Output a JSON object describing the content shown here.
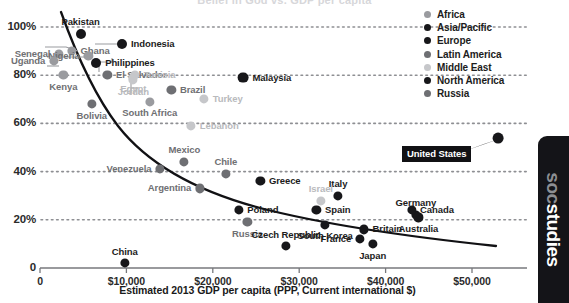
{
  "title_clipped": "Belief in God vs. GDP per capita",
  "axes": {
    "y_ticks": [
      "100%",
      "80%",
      "60%",
      "40%",
      "20%",
      "0"
    ],
    "x_ticks": [
      "0",
      "$10,000",
      "$20,000",
      "$30,000",
      "$40,000",
      "$50,000"
    ],
    "x_title": "Estimated 2013 GDP per capita (PPP, Current international $)"
  },
  "legend": {
    "items": [
      {
        "label": "Africa",
        "color": "#9a9b9f"
      },
      {
        "label": "Asia/Pacific",
        "color": "#17171a"
      },
      {
        "label": "Europe",
        "color": "#17171a"
      },
      {
        "label": "Latin America",
        "color": "#6e6f73"
      },
      {
        "label": "Middle East",
        "color": "#c6c7ca"
      },
      {
        "label": "North America",
        "color": "#17171a"
      },
      {
        "label": "Russia",
        "color": "#6e6f73"
      }
    ]
  },
  "callout": {
    "label": "United States"
  },
  "brand": {
    "part1": "soc",
    "part2": "studies"
  },
  "colors": {
    "africa": "#9a9b9f",
    "asia_pacific": "#17171a",
    "europe": "#17171a",
    "latin_america": "#6e6f73",
    "middle_east": "#c6c7ca",
    "north_america": "#17171a",
    "russia": "#6e6f73",
    "trendline": "#111114",
    "gridline": "#8e8f93"
  },
  "chart_data": {
    "type": "scatter",
    "title": "Belief in God vs. GDP per capita",
    "xlabel": "Estimated 2013 GDP per capita (PPP, Current international $)",
    "ylabel": "",
    "xlim": [
      0,
      56000
    ],
    "ylim": [
      0,
      108
    ],
    "grid": "horizontal dotted",
    "legend_position": "top-right",
    "series_key": "region",
    "points": [
      {
        "name": "Pakistan",
        "region": "Asia/Pacific",
        "x": 4700,
        "y": 97,
        "label_pos": "above",
        "color": "#17171a",
        "size": 5.0
      },
      {
        "name": "Indonesia",
        "region": "Asia/Pacific",
        "x": 9500,
        "y": 93,
        "label_pos": "right",
        "color": "#17171a",
        "size": 5.0
      },
      {
        "name": "Ghana",
        "region": "Africa",
        "x": 3700,
        "y": 90,
        "label_pos": "right",
        "color": "#9a9b9f",
        "size": 4.6
      },
      {
        "name": "Senegal",
        "region": "Africa",
        "x": 2200,
        "y": 89,
        "label_pos": "left",
        "color": "#9a9b9f",
        "size": 4.6
      },
      {
        "name": "Nigeria",
        "region": "Africa",
        "x": 5600,
        "y": 88,
        "label_pos": "left",
        "color": "#9a9b9f",
        "size": 4.6
      },
      {
        "name": "Uganda",
        "region": "Africa",
        "x": 1600,
        "y": 86,
        "label_pos": "left",
        "color": "#9a9b9f",
        "size": 4.6
      },
      {
        "name": "Philippines",
        "region": "Asia/Pacific",
        "x": 6500,
        "y": 85,
        "label_pos": "right",
        "color": "#17171a",
        "size": 5.0
      },
      {
        "name": "El Salvador",
        "region": "Latin America",
        "x": 7800,
        "y": 80,
        "label_pos": "right",
        "color": "#6e6f73",
        "size": 4.6
      },
      {
        "name": "Kenya",
        "region": "Africa",
        "x": 2700,
        "y": 80,
        "label_pos": "below",
        "color": "#9a9b9f",
        "size": 4.6
      },
      {
        "name": "Egypt",
        "region": "Middle East",
        "x": 10800,
        "y": 79,
        "label_pos": "below",
        "color": "#c6c7ca",
        "size": 4.6
      },
      {
        "name": "Jordan",
        "region": "Middle East",
        "x": 10800,
        "y": 78,
        "label_pos": "below",
        "color": "#c6c7ca",
        "size": 4.6
      },
      {
        "name": "Tunisia",
        "region": "Middle East",
        "x": 11000,
        "y": 80,
        "label_pos": "right",
        "color": "#c6c7ca",
        "size": 4.6
      },
      {
        "name": "Malaysia",
        "region": "Asia/Pacific",
        "x": 23500,
        "y": 79,
        "label_pos": "right",
        "color": "#17171a",
        "size": 5.4
      },
      {
        "name": "Brazil",
        "region": "Latin America",
        "x": 15200,
        "y": 74,
        "label_pos": "right",
        "color": "#6e6f73",
        "size": 4.6
      },
      {
        "name": "Turkey",
        "region": "Middle East",
        "x": 19000,
        "y": 70,
        "label_pos": "right",
        "color": "#c6c7ca",
        "size": 4.6
      },
      {
        "name": "South Africa",
        "region": "Africa",
        "x": 12700,
        "y": 69,
        "label_pos": "below",
        "color": "#9a9b9f",
        "size": 4.6
      },
      {
        "name": "Bolivia",
        "region": "Latin America",
        "x": 6000,
        "y": 68,
        "label_pos": "below",
        "color": "#6e6f73",
        "size": 4.6
      },
      {
        "name": "Lebanon",
        "region": "Middle East",
        "x": 17500,
        "y": 59,
        "label_pos": "right",
        "color": "#c6c7ca",
        "size": 4.6
      },
      {
        "name": "Mexico",
        "region": "Latin America",
        "x": 16700,
        "y": 44,
        "label_pos": "above",
        "color": "#6e6f73",
        "size": 4.6
      },
      {
        "name": "Venezuela",
        "region": "Latin America",
        "x": 13900,
        "y": 41,
        "label_pos": "left",
        "color": "#6e6f73",
        "size": 4.6
      },
      {
        "name": "Chile",
        "region": "Latin America",
        "x": 21500,
        "y": 39,
        "label_pos": "above",
        "color": "#6e6f73",
        "size": 4.6
      },
      {
        "name": "Greece",
        "region": "Europe",
        "x": 25500,
        "y": 36,
        "label_pos": "right",
        "color": "#17171a",
        "size": 4.6
      },
      {
        "name": "Argentina",
        "region": "Latin America",
        "x": 18500,
        "y": 33,
        "label_pos": "left",
        "color": "#6e6f73",
        "size": 4.6
      },
      {
        "name": "Italy",
        "region": "Europe",
        "x": 34500,
        "y": 30,
        "label_pos": "above",
        "color": "#17171a",
        "size": 4.6
      },
      {
        "name": "Israel",
        "region": "Middle East",
        "x": 32500,
        "y": 28,
        "label_pos": "above",
        "color": "#c6c7ca",
        "size": 4.6
      },
      {
        "name": "Poland",
        "region": "Europe",
        "x": 23000,
        "y": 24,
        "label_pos": "right",
        "color": "#17171a",
        "size": 4.6
      },
      {
        "name": "Spain",
        "region": "Europe",
        "x": 32000,
        "y": 24,
        "label_pos": "right",
        "color": "#17171a",
        "size": 4.6
      },
      {
        "name": "Germany",
        "region": "Europe",
        "x": 43500,
        "y": 22,
        "label_pos": "above",
        "color": "#17171a",
        "size": 4.6
      },
      {
        "name": "Canada",
        "region": "North America",
        "x": 43000,
        "y": 24,
        "label_pos": "right",
        "color": "#17171a",
        "size": 4.6
      },
      {
        "name": "Australia",
        "region": "Asia/Pacific",
        "x": 43800,
        "y": 21,
        "label_pos": "below",
        "color": "#17171a",
        "size": 4.6
      },
      {
        "name": "Russia",
        "region": "Russia",
        "x": 24000,
        "y": 19,
        "label_pos": "below",
        "color": "#6e6f73",
        "size": 4.6
      },
      {
        "name": "South Korea",
        "region": "Asia/Pacific",
        "x": 33000,
        "y": 18,
        "label_pos": "below",
        "color": "#17171a",
        "size": 4.6
      },
      {
        "name": "Britain",
        "region": "Europe",
        "x": 37500,
        "y": 16,
        "label_pos": "right",
        "color": "#17171a",
        "size": 4.6
      },
      {
        "name": "France",
        "region": "Europe",
        "x": 37000,
        "y": 12,
        "label_pos": "left",
        "color": "#17171a",
        "size": 4.6
      },
      {
        "name": "Japan",
        "region": "Asia/Pacific",
        "x": 38500,
        "y": 10,
        "label_pos": "below",
        "color": "#17171a",
        "size": 4.6
      },
      {
        "name": "Czech Republic",
        "region": "Europe",
        "x": 28500,
        "y": 9,
        "label_pos": "above",
        "color": "#17171a",
        "size": 4.6
      },
      {
        "name": "China",
        "region": "Asia/Pacific",
        "x": 9800,
        "y": 2,
        "label_pos": "above",
        "color": "#17171a",
        "size": 4.6
      },
      {
        "name": "United States",
        "region": "North America",
        "x": 53000,
        "y": 54,
        "label_pos": "callout",
        "color": "#17171a",
        "size": 5.4
      }
    ]
  }
}
